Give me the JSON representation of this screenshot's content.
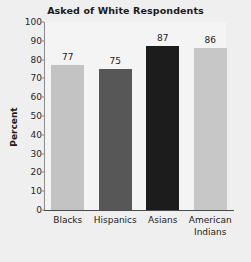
{
  "chart_data": {
    "type": "bar",
    "title": "Asked of White Respondents",
    "xlabel": "",
    "ylabel": "Percent",
    "categories": [
      "Blacks",
      "Hispanics",
      "Asians",
      "American Indians"
    ],
    "values": [
      77,
      75,
      87,
      86
    ],
    "value_labels": [
      "77",
      "75",
      "87",
      "86"
    ],
    "bar_colors": [
      "#c3c3c3",
      "#575757",
      "#1c1c1c",
      "#c7c7c7"
    ],
    "ylim": [
      0,
      100
    ],
    "yticks": [
      0,
      10,
      20,
      30,
      40,
      50,
      60,
      70,
      80,
      90,
      100
    ],
    "ytick_labels": [
      "0",
      "10",
      "20",
      "30",
      "40",
      "50",
      "60",
      "70",
      "80",
      "90",
      "100"
    ],
    "grid": false,
    "legend": false,
    "background_color": "#efefef",
    "axis_color": "#4a4a4a"
  }
}
